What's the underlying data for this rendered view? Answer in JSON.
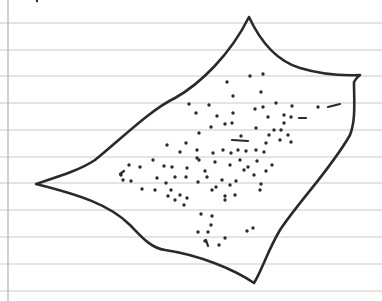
{
  "paper": {
    "background": "#ffffff",
    "rule_color": "#c9c9c9",
    "margin_color": "#b0b0b0",
    "margin_x": 8,
    "rule_ys": [
      23,
      50,
      76,
      103,
      130,
      157,
      183,
      210,
      237,
      264,
      291
    ]
  },
  "ink": {
    "color": "#2a2a2a",
    "outline_width": 2.6
  },
  "sketch": {
    "description": "Hand-drawn four-cornered sheet shape with concave edges, filled with scattered ink dots",
    "corners": {
      "top": [
        249,
        17
      ],
      "right": [
        360,
        75
      ],
      "bottom": [
        254,
        283
      ],
      "left": [
        36,
        184
      ]
    },
    "outline_path": "M36,184 C60,176 80,170 95,160 C120,140 150,110 175,98 C200,84 230,55 249,17 C262,45 280,62 300,68 C320,74 340,76 360,75 C356,78 355,80 354,82 C354,100 356,120 350,135 C330,170 300,200 280,230 C268,250 262,270 254,283 C235,270 200,255 165,250 C150,248 140,235 130,225 C110,205 80,195 36,184 Z",
    "top_mark": [
      37,
      1
    ],
    "dots": [
      [
        250,
        76
      ],
      [
        263,
        74
      ],
      [
        227,
        82
      ],
      [
        233,
        96
      ],
      [
        209,
        105
      ],
      [
        233,
        113
      ],
      [
        255,
        109
      ],
      [
        263,
        107
      ],
      [
        232,
        123
      ],
      [
        256,
        128
      ],
      [
        292,
        106
      ],
      [
        268,
        117
      ],
      [
        291,
        117
      ],
      [
        284,
        123
      ],
      [
        281,
        130
      ],
      [
        274,
        130
      ],
      [
        269,
        135
      ],
      [
        288,
        135
      ],
      [
        280,
        140
      ],
      [
        291,
        142
      ],
      [
        189,
        104
      ],
      [
        196,
        113
      ],
      [
        217,
        116
      ],
      [
        225,
        124
      ],
      [
        211,
        127
      ],
      [
        199,
        133
      ],
      [
        167,
        145
      ],
      [
        186,
        143
      ],
      [
        180,
        152
      ],
      [
        197,
        150
      ],
      [
        213,
        153
      ],
      [
        223,
        150
      ],
      [
        241,
        136
      ],
      [
        256,
        150
      ],
      [
        266,
        143
      ],
      [
        197,
        158
      ],
      [
        231,
        153
      ],
      [
        246,
        151
      ],
      [
        238,
        150
      ],
      [
        257,
        161
      ],
      [
        140,
        167
      ],
      [
        153,
        160
      ],
      [
        129,
        165
      ],
      [
        164,
        166
      ],
      [
        172,
        167
      ],
      [
        157,
        178
      ],
      [
        175,
        177
      ],
      [
        186,
        177
      ],
      [
        207,
        177
      ],
      [
        205,
        171
      ],
      [
        198,
        182
      ],
      [
        222,
        180
      ],
      [
        199,
        160
      ],
      [
        216,
        187
      ],
      [
        230,
        185
      ],
      [
        225,
        200
      ],
      [
        235,
        195
      ],
      [
        236,
        181
      ],
      [
        254,
        175
      ],
      [
        261,
        184
      ],
      [
        121,
        175
      ],
      [
        123,
        180
      ],
      [
        131,
        181
      ],
      [
        142,
        189
      ],
      [
        155,
        190
      ],
      [
        168,
        196
      ],
      [
        175,
        200
      ],
      [
        180,
        195
      ],
      [
        184,
        205
      ],
      [
        187,
        198
      ],
      [
        166,
        183
      ],
      [
        171,
        190
      ],
      [
        212,
        190
      ],
      [
        225,
        196
      ],
      [
        240,
        160
      ],
      [
        248,
        167
      ],
      [
        260,
        190
      ],
      [
        272,
        165
      ],
      [
        266,
        171
      ],
      [
        244,
        170
      ],
      [
        212,
        216
      ],
      [
        201,
        214
      ],
      [
        211,
        225
      ],
      [
        198,
        232
      ],
      [
        208,
        232
      ],
      [
        205,
        241
      ],
      [
        219,
        245
      ],
      [
        225,
        238
      ],
      [
        247,
        231
      ],
      [
        253,
        228
      ],
      [
        215,
        162
      ],
      [
        230,
        165
      ],
      [
        187,
        168
      ],
      [
        264,
        152
      ],
      [
        318,
        107
      ],
      [
        261,
        92
      ],
      [
        276,
        103
      ],
      [
        284,
        115
      ]
    ],
    "dashes": [
      [
        [
          328,
          107
        ],
        [
          340,
          104
        ]
      ],
      [
        [
          232,
          140
        ],
        [
          248,
          141
        ]
      ],
      [
        [
          299,
          118
        ],
        [
          306,
          118
        ]
      ],
      [
        [
          206,
          240
        ],
        [
          208,
          246
        ]
      ],
      [
        [
          120,
          174
        ],
        [
          124,
          171
        ]
      ]
    ]
  }
}
